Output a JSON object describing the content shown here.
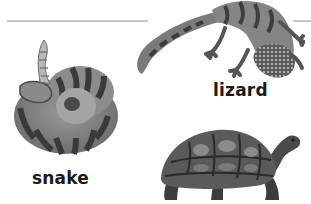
{
  "worksheet": {
    "rules": [
      {
        "name": "top-left-rule",
        "color": "#c8c8c8"
      },
      {
        "name": "top-right-rule",
        "color": "#c8c8c8"
      }
    ],
    "animals": [
      {
        "id": "lizard",
        "label": "lizard",
        "illustration": "lizard-illustration"
      },
      {
        "id": "snake",
        "label": "snake",
        "illustration": "coiled-snake-illustration"
      },
      {
        "id": "tortoise",
        "label": "",
        "illustration": "tortoise-illustration"
      }
    ]
  },
  "colors": {
    "text": "#1a1a1a",
    "rule": "#c8c8c8",
    "dark": "#2e2e2e",
    "mid": "#6e6e6e",
    "light": "#b4b4b4"
  }
}
